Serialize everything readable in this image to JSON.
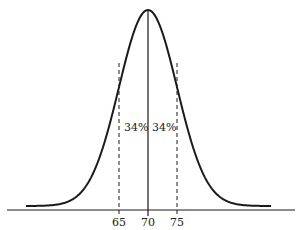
{
  "figure": {
    "type": "normal-distribution-curve",
    "mean": 70,
    "std_dev": 5,
    "x_ticks": [
      {
        "value": 65,
        "label": "65",
        "line": "dashed"
      },
      {
        "value": 70,
        "label": "70",
        "line": "solid"
      },
      {
        "value": 75,
        "label": "75",
        "line": "dashed"
      }
    ],
    "regions": [
      {
        "from": 65,
        "to": 70,
        "label": "34%"
      },
      {
        "from": 70,
        "to": 75,
        "label": "34%"
      }
    ],
    "colors": {
      "line": "#1a1a1a",
      "axis": "#666666",
      "background": "#ffffff"
    }
  }
}
